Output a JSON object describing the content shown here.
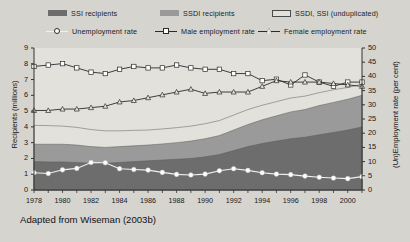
{
  "legend": {
    "areas": [
      {
        "name": "ssi-recipients",
        "label": "SSI recipients",
        "color": "#6d6d6d"
      },
      {
        "name": "ssdi-recipients",
        "label": "SSDI recipients",
        "color": "#9a9a9a"
      },
      {
        "name": "ssdi-ssi-unduplicated",
        "label": "SSDI, SSI (unduplicated)",
        "color": "#e3e1dc"
      }
    ],
    "lines": [
      {
        "name": "unemployment-rate",
        "label": "Unemployment rate",
        "marker": "circle"
      },
      {
        "name": "male-employment-rate",
        "label": "Male employment rate",
        "marker": "square"
      },
      {
        "name": "female-employment-rate",
        "label": "Female employment rate",
        "marker": "triangle"
      }
    ]
  },
  "caption": "Adapted from Wiseman (2003b)",
  "chart_data": {
    "type": "area",
    "title": "",
    "xlabel": "",
    "ylabel": "Recipients (millions)",
    "y2label": "(Un)Employment rate (per cent)",
    "ylim": [
      0,
      9
    ],
    "y2lim": [
      0,
      50
    ],
    "xlim": [
      1978,
      2001
    ],
    "grid": false,
    "legend_position": "top",
    "yticks": [
      0,
      1,
      2,
      3,
      4,
      5,
      6,
      7,
      8,
      9
    ],
    "y2ticks": [
      0,
      5,
      10,
      15,
      20,
      25,
      30,
      35,
      40,
      45,
      50
    ],
    "x": [
      1978,
      1979,
      1980,
      1981,
      1982,
      1983,
      1984,
      1985,
      1986,
      1987,
      1988,
      1989,
      1990,
      1991,
      1992,
      1993,
      1994,
      1995,
      1996,
      1997,
      1998,
      1999,
      2000,
      2001
    ],
    "xticks": [
      1978,
      1980,
      1982,
      1984,
      1986,
      1988,
      1990,
      1992,
      1994,
      1996,
      1998,
      2000
    ],
    "stacked_areas": [
      {
        "name": "SSI recipients",
        "axis": "left",
        "color": "#6d6d6d",
        "values": [
          1.8,
          1.78,
          1.78,
          1.75,
          1.7,
          1.7,
          1.75,
          1.8,
          1.85,
          1.9,
          1.95,
          2.0,
          2.1,
          2.25,
          2.5,
          2.75,
          2.95,
          3.1,
          3.25,
          3.35,
          3.5,
          3.65,
          3.8,
          4.0
        ]
      },
      {
        "name": "SSDI recipients",
        "axis": "left",
        "color": "#9a9a9a",
        "values": [
          1.1,
          1.12,
          1.12,
          1.1,
          1.05,
          1.0,
          1.0,
          1.0,
          1.0,
          1.02,
          1.05,
          1.1,
          1.15,
          1.2,
          1.3,
          1.4,
          1.5,
          1.6,
          1.7,
          1.75,
          1.85,
          1.9,
          1.95,
          2.0
        ]
      },
      {
        "name": "SSDI, SSI (unduplicated)",
        "axis": "left",
        "color": "#e3e1dc",
        "values": [
          1.2,
          1.18,
          1.15,
          1.12,
          1.08,
          1.05,
          1.0,
          0.98,
          0.95,
          0.95,
          0.95,
          0.95,
          0.95,
          0.95,
          0.95,
          0.95,
          0.92,
          0.9,
          0.88,
          0.85,
          0.82,
          0.8,
          0.75,
          0.7
        ]
      }
    ],
    "cumulative_tops": {
      "ssi": [
        1.8,
        1.78,
        1.78,
        1.75,
        1.7,
        1.7,
        1.75,
        1.8,
        1.85,
        1.9,
        1.95,
        2.0,
        2.1,
        2.25,
        2.5,
        2.75,
        2.95,
        3.1,
        3.25,
        3.35,
        3.5,
        3.65,
        3.8,
        4.0
      ],
      "ssdi": [
        2.9,
        2.9,
        2.9,
        2.85,
        2.75,
        2.7,
        2.75,
        2.8,
        2.85,
        2.92,
        3.0,
        3.1,
        3.25,
        3.45,
        3.8,
        4.15,
        4.45,
        4.7,
        4.95,
        5.1,
        5.35,
        5.55,
        5.75,
        6.0
      ],
      "unduplicated": [
        4.1,
        4.08,
        4.05,
        3.97,
        3.83,
        3.75,
        3.75,
        3.78,
        3.8,
        3.87,
        3.95,
        4.05,
        4.2,
        4.4,
        4.75,
        5.1,
        5.37,
        5.6,
        5.83,
        5.95,
        6.17,
        6.35,
        6.5,
        6.7
      ]
    },
    "series": [
      {
        "name": "Unemployment rate",
        "axis": "right",
        "marker": "circle",
        "values": [
          6.1,
          5.8,
          7.1,
          7.6,
          9.7,
          9.6,
          7.5,
          7.2,
          7.0,
          6.2,
          5.5,
          5.3,
          5.6,
          6.8,
          7.5,
          6.9,
          6.1,
          5.6,
          5.4,
          4.9,
          4.5,
          4.2,
          4.0,
          4.7
        ]
      },
      {
        "name": "Male employment rate",
        "axis": "right",
        "marker": "square",
        "values": [
          43.5,
          44.0,
          44.5,
          43.0,
          41.5,
          41.0,
          42.5,
          43.5,
          43.0,
          43.0,
          44.0,
          43.0,
          42.5,
          42.5,
          41.0,
          41.0,
          38.5,
          39.0,
          37.0,
          40.5,
          38.0,
          36.5,
          38.0,
          38.0
        ]
      },
      {
        "name": "Female employment rate",
        "axis": "right",
        "marker": "triangle",
        "values": [
          28.0,
          28.0,
          28.5,
          28.5,
          29.0,
          29.5,
          31.0,
          31.5,
          32.5,
          33.5,
          34.5,
          35.5,
          34.0,
          34.5,
          34.5,
          34.5,
          36.5,
          38.5,
          38.0,
          38.0,
          38.0,
          37.5,
          37.0,
          36.5
        ]
      }
    ]
  }
}
